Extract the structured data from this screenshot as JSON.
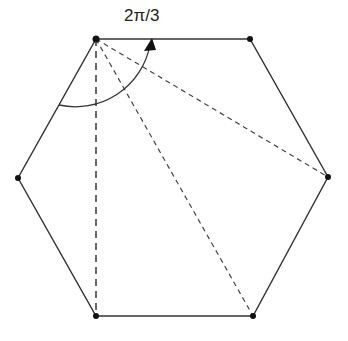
{
  "diagram": {
    "type": "regular-hexagon-diagonals",
    "angle_label": "2π/3",
    "vertices": [
      {
        "name": "top-left",
        "x": 96,
        "y": 39
      },
      {
        "name": "top-right",
        "x": 250,
        "y": 39
      },
      {
        "name": "right",
        "x": 328,
        "y": 177
      },
      {
        "name": "bottom-right",
        "x": 253,
        "y": 316
      },
      {
        "name": "bottom-left",
        "x": 96,
        "y": 316
      },
      {
        "name": "left",
        "x": 18,
        "y": 178
      }
    ],
    "diagonals_from": "top-left",
    "colors": {
      "stroke": "#333333",
      "dashed": "#444444"
    }
  }
}
